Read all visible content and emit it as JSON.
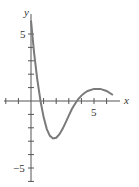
{
  "chart_data": {
    "type": "line",
    "title": "",
    "xlabel": "x",
    "ylabel": "y",
    "x_tick_labels": [
      "5"
    ],
    "y_tick_labels": [
      "5",
      "-5"
    ],
    "xlim": [
      -2,
      6.5
    ],
    "ylim": [
      -6,
      7
    ],
    "grid": false,
    "series": [
      {
        "name": "f(x)",
        "color": "#7a7a7a",
        "x": [
          0,
          0.25,
          0.5,
          0.75,
          1,
          1.25,
          1.5,
          1.75,
          2,
          2.25,
          2.5,
          2.75,
          3,
          3.25,
          3.5,
          3.75,
          4,
          4.25,
          4.5,
          5,
          5.5,
          6,
          6.5
        ],
        "y": [
          6,
          3.6,
          1.6,
          0,
          -1.2,
          -2.1,
          -2.6,
          -2.8,
          -2.75,
          -2.5,
          -2.1,
          -1.6,
          -1.1,
          -0.6,
          -0.2,
          0.15,
          0.4,
          0.6,
          0.75,
          0.9,
          0.9,
          0.75,
          0.45
        ]
      }
    ]
  },
  "axes": {
    "x_label": "x",
    "y_label": "y",
    "x_tick_5": "5",
    "y_tick_5": "5",
    "y_tick_neg5": "−5"
  }
}
